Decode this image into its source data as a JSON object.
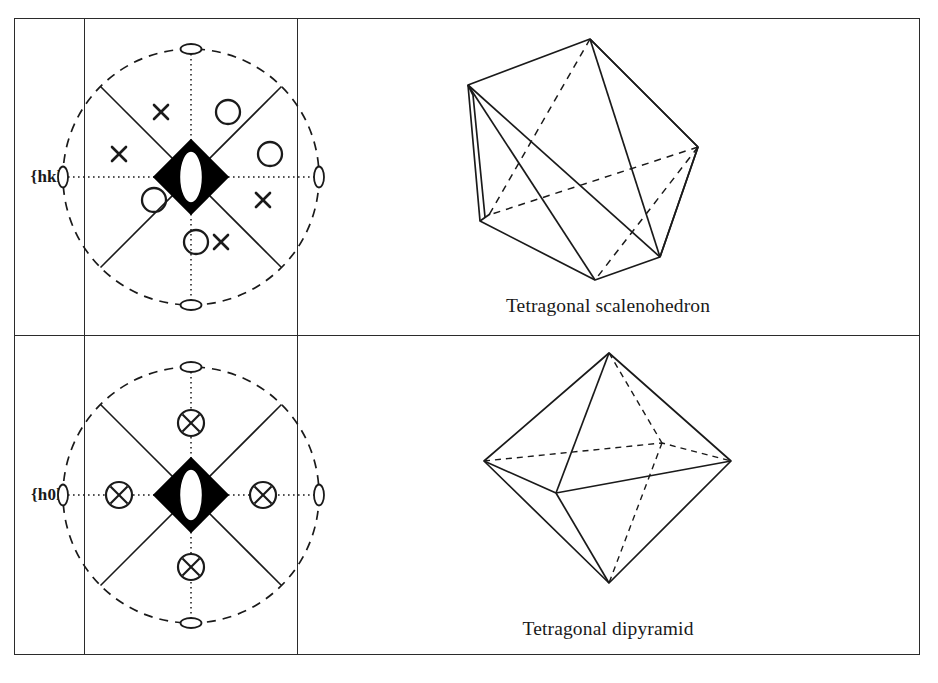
{
  "figure": {
    "kind": "crystallography-form-table",
    "rows": [
      {
        "form_symbol": "{hkl}",
        "crystal_caption": "Tetragonal scalenohedron",
        "stereogram": {
          "center_symbol": "four-bar-inversion-axis",
          "primitive_circle": "dashed",
          "axes": "dotted",
          "mirror_traces": "solid-diagonal",
          "edge_two_fold_axes": 4,
          "poles": [
            {
              "label": "x",
              "type": "lower-hemisphere",
              "angle_deg": 112.5,
              "radius_frac": 0.63
            },
            {
              "label": "o",
              "type": "upper-hemisphere",
              "angle_deg": 67.5,
              "radius_frac": 0.63
            },
            {
              "label": "o",
              "type": "upper-hemisphere",
              "angle_deg": 22.5,
              "radius_frac": 0.63
            },
            {
              "label": "x",
              "type": "lower-hemisphere",
              "angle_deg": 337.5,
              "radius_frac": 0.63
            },
            {
              "label": "x",
              "type": "lower-hemisphere",
              "angle_deg": 292.5,
              "radius_frac": 0.63
            },
            {
              "label": "o",
              "type": "upper-hemisphere",
              "angle_deg": 247.5,
              "radius_frac": 0.63
            },
            {
              "label": "o",
              "type": "upper-hemisphere",
              "angle_deg": 202.5,
              "radius_frac": 0.63
            },
            {
              "label": "x",
              "type": "lower-hemisphere",
              "angle_deg": 157.5,
              "radius_frac": 0.63
            }
          ]
        }
      },
      {
        "form_symbol": "{h0l}",
        "crystal_caption": "Tetragonal dipyramid",
        "stereogram": {
          "center_symbol": "four-bar-inversion-axis",
          "primitive_circle": "dashed",
          "axes": "dotted",
          "mirror_traces": "solid-diagonal",
          "edge_two_fold_axes": 4,
          "poles": [
            {
              "label": "circled-x",
              "type": "coincident-upper-and-lower",
              "angle_deg": 90,
              "radius_frac": 0.56
            },
            {
              "label": "circled-x",
              "type": "coincident-upper-and-lower",
              "angle_deg": 0,
              "radius_frac": 0.56
            },
            {
              "label": "circled-x",
              "type": "coincident-upper-and-lower",
              "angle_deg": 270,
              "radius_frac": 0.56
            },
            {
              "label": "circled-x",
              "type": "coincident-upper-and-lower",
              "angle_deg": 180,
              "radius_frac": 0.56
            }
          ]
        }
      }
    ]
  },
  "colors": {
    "ink": "#1a1a1a",
    "rule": "#2b2b2b",
    "fill": "#000000",
    "paper": "#ffffff"
  }
}
